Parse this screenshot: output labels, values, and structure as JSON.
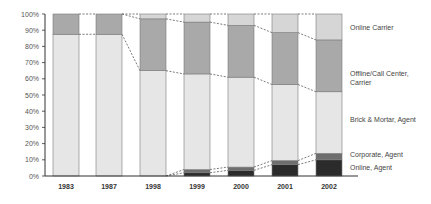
{
  "chart_data": {
    "type": "bar",
    "stacked": true,
    "percent": true,
    "title": "",
    "xlabel": "",
    "ylabel": "",
    "ylim": [
      0,
      100
    ],
    "yticks": [
      "0%",
      "10%",
      "20%",
      "30%",
      "40%",
      "50%",
      "60%",
      "70%",
      "80%",
      "90%",
      "100%"
    ],
    "categories": [
      "1983",
      "1987",
      "1998",
      "1999",
      "2000",
      "2001",
      "2002"
    ],
    "series": [
      {
        "name": "Online, Agent",
        "color": "#2b2b2b",
        "values": [
          0,
          0,
          0,
          2,
          3.5,
          7,
          10
        ]
      },
      {
        "name": "Corporate, Agent",
        "color": "#6e6e6e",
        "values": [
          0,
          0,
          0,
          2,
          2,
          2.5,
          4
        ]
      },
      {
        "name": "Brick & Mortar, Agent",
        "color": "#e6e6e6",
        "values": [
          87.5,
          87.5,
          65,
          59,
          55.5,
          47,
          38
        ]
      },
      {
        "name": "Offline/Call Center, Carrier",
        "color": "#a9a9a9",
        "values": [
          12.5,
          12.5,
          32,
          32,
          32,
          32,
          32
        ]
      },
      {
        "name": "Online Carrier",
        "color": "#d6d6d6",
        "values": [
          0,
          0,
          3,
          5,
          7,
          11.5,
          16
        ]
      }
    ],
    "legend_position": "right",
    "legend_labels": [
      {
        "series": "Online Carrier",
        "lines": [
          "Online Carrier"
        ]
      },
      {
        "series": "Offline/Call Center, Carrier",
        "lines": [
          "Offline/Call Center,",
          "Carrier"
        ]
      },
      {
        "series": "Brick & Mortar, Agent",
        "lines": [
          "Brick & Mortar, Agent"
        ]
      },
      {
        "series": "Corporate, Agent",
        "lines": [
          "Corporate, Agent"
        ]
      },
      {
        "series": "Online, Agent",
        "lines": [
          "Online, Agent"
        ]
      }
    ],
    "connector_lines": "dashed",
    "grid": false
  }
}
